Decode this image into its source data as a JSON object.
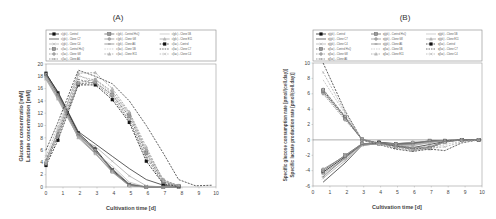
{
  "legend_entries": [
    "c(glc) - Control",
    "c(glc) - Control HsQ",
    "c(glc) - Clone 5B",
    "c(glc) - Clone C7",
    "c(glc) - Clone G8",
    "c(glc) - Clone E11",
    "c(glc) - Clone C4",
    "c(glc) - Clone A6",
    "c(lac) - Control",
    "c(lac) - Control HsQ",
    "c(lac) - Clone 5B",
    "c(lac) - Clone C7",
    "c(lac) - Clone G8",
    "c(lac) - Clone E11",
    "c(lac) - Clone C4",
    "c(lac) - Clone A6"
  ],
  "chart_data": [
    {
      "type": "line",
      "title": "(A)",
      "xlabel": "Cultivation time [d]",
      "ylabel": [
        "Glucose concentratio [mM]",
        "Lactate concentration [mM]"
      ],
      "xlim": [
        0,
        10
      ],
      "ylim": [
        0,
        20
      ],
      "xticks": [
        0,
        1,
        2,
        3,
        4,
        5,
        6,
        7,
        8,
        9,
        10
      ],
      "yticks": [
        0,
        2,
        4,
        6,
        8,
        10,
        12,
        14,
        16,
        18,
        20
      ],
      "grid": false,
      "legend_position": "top",
      "series": [
        {
          "name": "c(glc) - Control",
          "style": "solid",
          "marker": "square-filled",
          "x": [
            0,
            0.7,
            1.9,
            2.9,
            3.9,
            4.9,
            5.9,
            6.9,
            7.8
          ],
          "y": [
            18.5,
            15.3,
            8.8,
            6.2,
            2.8,
            0.4,
            0,
            0,
            0
          ]
        },
        {
          "name": "c(glc) - Control HsQ",
          "style": "solid",
          "marker": "square",
          "x": [
            0,
            0.7,
            1.9,
            2.9,
            3.9,
            4.9,
            5.9,
            6.9,
            7.8
          ],
          "y": [
            18.3,
            15.0,
            8.6,
            6.0,
            2.6,
            0.3,
            0,
            0,
            0
          ]
        },
        {
          "name": "c(glc) - Clone 5B",
          "style": "solid",
          "marker": "none",
          "x": [
            0,
            0.7,
            1.9,
            2.9,
            3.9,
            4.9,
            5.9,
            6.9,
            7.8
          ],
          "y": [
            18.0,
            14.8,
            8.4,
            5.6,
            3.4,
            0.8,
            0,
            0,
            0
          ]
        },
        {
          "name": "c(glc) - Clone C7",
          "style": "solid",
          "marker": "none",
          "x": [
            0,
            0.7,
            1.9,
            2.9,
            3.9,
            4.9,
            5.9,
            6.9,
            7.8
          ],
          "y": [
            18.4,
            15.5,
            9.0,
            7.0,
            5.0,
            3.0,
            1.2,
            0.3,
            0
          ]
        },
        {
          "name": "c(glc) - Clone G8",
          "style": "solid",
          "marker": "circle",
          "x": [
            0,
            0.7,
            1.9,
            2.9,
            3.9,
            4.9,
            5.9,
            6.9,
            7.8
          ],
          "y": [
            17.8,
            14.6,
            8.2,
            5.5,
            2.5,
            0.2,
            0,
            0,
            0
          ]
        },
        {
          "name": "c(glc) - Clone E11",
          "style": "solid",
          "marker": "triangle",
          "x": [
            0,
            0.7,
            1.9,
            2.9,
            3.9,
            4.9,
            5.9,
            6.9,
            7.8
          ],
          "y": [
            17.6,
            14.4,
            8.0,
            5.4,
            2.4,
            0.2,
            0,
            0,
            0
          ]
        },
        {
          "name": "c(glc) - Clone C4",
          "style": "solid",
          "marker": "x",
          "x": [
            0,
            0.7,
            1.9,
            2.9,
            3.9,
            4.9,
            5.9,
            6.9,
            7.8
          ],
          "y": [
            17.5,
            14.2,
            8.1,
            6.6,
            4.2,
            1.8,
            0.2,
            0,
            0
          ]
        },
        {
          "name": "c(glc) - Clone A6",
          "style": "solid",
          "marker": "dash",
          "x": [
            0,
            0.7,
            1.9,
            2.9,
            3.9,
            4.9,
            5.9,
            6.9,
            7.8
          ],
          "y": [
            18.2,
            15.0,
            8.5,
            5.8,
            3.0,
            0.5,
            0,
            0,
            0
          ]
        },
        {
          "name": "c(lac) - Control",
          "style": "dashed",
          "marker": "square-filled",
          "x": [
            0,
            0.7,
            1.9,
            2.9,
            3.9,
            4.9,
            5.9,
            6.9,
            7.8
          ],
          "y": [
            3.5,
            7.6,
            16.6,
            16.6,
            14.2,
            10.5,
            4.2,
            0.5,
            0.1
          ]
        },
        {
          "name": "c(lac) - Control HsQ",
          "style": "dashed",
          "marker": "square",
          "x": [
            0,
            0.7,
            1.9,
            2.9,
            3.9,
            4.9,
            5.9,
            6.9,
            7.8
          ],
          "y": [
            3.8,
            8.3,
            16.8,
            17.0,
            15.0,
            11.5,
            5.5,
            0.8,
            0.2
          ]
        },
        {
          "name": "c(lac) - Clone 5B",
          "style": "dashed",
          "marker": "none",
          "x": [
            0,
            0.7,
            1.9,
            2.9,
            3.9,
            4.9,
            5.9,
            6.9,
            7.8
          ],
          "y": [
            4.5,
            9.0,
            18.0,
            17.4,
            15.2,
            11.8,
            5.8,
            1.0,
            0.3
          ]
        },
        {
          "name": "c(lac) - Clone C7",
          "style": "dashed",
          "marker": "none",
          "x": [
            0,
            0.7,
            1.9,
            2.9,
            3.9,
            4.9,
            5.9,
            6.9,
            7.8,
            8.8,
            9.8
          ],
          "y": [
            6.0,
            10.5,
            19.0,
            18.0,
            16.8,
            14.0,
            10.0,
            5.5,
            1.2,
            0.2,
            0.3
          ]
        },
        {
          "name": "c(lac) - Clone G8",
          "style": "dashed",
          "marker": "circle",
          "x": [
            0,
            0.7,
            1.9,
            2.9,
            3.9,
            4.9,
            5.9,
            6.9,
            7.8
          ],
          "y": [
            4.0,
            8.5,
            17.0,
            17.5,
            15.5,
            12.0,
            6.0,
            1.2,
            0.2
          ]
        },
        {
          "name": "c(lac) - Clone E11",
          "style": "dashed",
          "marker": "triangle",
          "x": [
            0,
            0.7,
            1.9,
            2.9,
            3.9,
            4.9,
            5.9,
            6.9,
            7.8
          ],
          "y": [
            4.2,
            9.2,
            18.5,
            18.6,
            16.0,
            12.2,
            6.5,
            1.0,
            0.2
          ]
        },
        {
          "name": "c(lac) - Clone C4",
          "style": "dashed",
          "marker": "x",
          "x": [
            0,
            0.7,
            1.9,
            2.9,
            3.9,
            4.9,
            5.9,
            6.9,
            7.8
          ],
          "y": [
            5.0,
            9.8,
            18.2,
            17.0,
            15.0,
            11.0,
            5.0,
            1.0,
            0.2
          ]
        },
        {
          "name": "c(lac) - Clone A6",
          "style": "dashed",
          "marker": "dash",
          "x": [
            0,
            0.7,
            1.9,
            2.9,
            3.9,
            4.9,
            5.9,
            6.9,
            7.8
          ],
          "y": [
            4.4,
            8.8,
            17.5,
            16.8,
            14.6,
            10.8,
            4.8,
            0.6,
            0.1
          ]
        }
      ]
    },
    {
      "type": "line",
      "title": "(B)",
      "xlabel": "Cultivation time [d]",
      "ylabel": [
        "Specific glucose consumption rate [pmol/(cell.day)]",
        "Specific lactate production rate [pmol/(cell.day)]"
      ],
      "xlim": [
        0,
        10
      ],
      "ylim": [
        -6,
        10
      ],
      "xticks": [
        0,
        1,
        2,
        3,
        4,
        5,
        6,
        7,
        8,
        9,
        10
      ],
      "yticks": [
        -6,
        -4,
        -2,
        0,
        2,
        4,
        6,
        8,
        10
      ],
      "grid": false,
      "legend_position": "top",
      "series": [
        {
          "name": "q(glc) - Control",
          "style": "solid",
          "marker": "square-filled",
          "x": [
            0.6,
            1.9,
            2.9,
            3.9,
            4.9,
            5.9,
            6.9,
            7.8,
            8.8,
            9.8
          ],
          "y": [
            -4.2,
            -2.2,
            -0.6,
            -0.3,
            -0.5,
            -0.4,
            -0.2,
            -0.1,
            0,
            0
          ]
        },
        {
          "name": "q(glc) - Control HsQ",
          "style": "solid",
          "marker": "square",
          "x": [
            0.6,
            1.9,
            2.9,
            3.9,
            4.9,
            5.9,
            6.9,
            7.8,
            8.8,
            9.8
          ],
          "y": [
            -4.0,
            -2.0,
            -0.5,
            -0.4,
            -0.6,
            -0.5,
            -0.1,
            -0.1,
            0,
            0
          ]
        },
        {
          "name": "q(glc) - Clone 5B",
          "style": "solid",
          "marker": "none",
          "x": [
            0.6,
            1.9,
            2.9,
            3.9,
            4.9,
            5.9,
            6.9,
            7.8,
            8.8,
            9.8
          ],
          "y": [
            -4.6,
            -2.5,
            -0.6,
            -0.5,
            -0.7,
            -0.8,
            -0.3,
            -0.1,
            0,
            0
          ]
        },
        {
          "name": "q(glc) - Clone C7",
          "style": "solid",
          "marker": "none",
          "x": [
            0.6,
            1.9,
            2.9,
            3.9,
            4.9,
            5.9,
            6.9,
            7.8,
            8.8,
            9.8
          ],
          "y": [
            -5.5,
            -3.0,
            -0.7,
            -0.5,
            -0.8,
            -1.0,
            -0.6,
            -0.2,
            0,
            0
          ]
        },
        {
          "name": "q(glc) - Clone G8",
          "style": "solid",
          "marker": "circle",
          "x": [
            0.6,
            1.9,
            2.9,
            3.9,
            4.9,
            5.9,
            6.9,
            7.8,
            8.8,
            9.8
          ],
          "y": [
            -3.8,
            -2.1,
            -0.5,
            -0.4,
            -0.5,
            -0.3,
            -0.2,
            -0.1,
            0,
            0
          ]
        },
        {
          "name": "q(glc) - Clone E11",
          "style": "solid",
          "marker": "triangle",
          "x": [
            0.6,
            1.9,
            2.9,
            3.9,
            4.9,
            5.9,
            6.9,
            7.8,
            8.8,
            9.8
          ],
          "y": [
            -4.4,
            -2.4,
            -0.6,
            -0.4,
            -0.6,
            -0.6,
            -0.3,
            -0.1,
            0,
            0
          ]
        },
        {
          "name": "q(glc) - Clone C4",
          "style": "solid",
          "marker": "x",
          "x": [
            0.6,
            1.9,
            2.9,
            3.9,
            4.9,
            5.9,
            6.9,
            7.8,
            8.8,
            9.8
          ],
          "y": [
            -5.0,
            -2.7,
            -0.7,
            -0.5,
            -0.7,
            -0.7,
            -0.4,
            -0.1,
            0,
            0
          ]
        },
        {
          "name": "q(glc) - Clone A6",
          "style": "solid",
          "marker": "dash",
          "x": [
            0.6,
            1.9,
            2.9,
            3.9,
            4.9,
            5.9,
            6.9,
            7.8,
            8.8,
            9.8
          ],
          "y": [
            -4.8,
            -2.3,
            -0.6,
            -0.4,
            -0.6,
            -0.5,
            -0.2,
            -0.1,
            0,
            0
          ]
        },
        {
          "name": "q(lac) - Control",
          "style": "dashed",
          "marker": "square-filled",
          "x": [
            0.6,
            1.9,
            2.9,
            3.9,
            4.9,
            5.9,
            6.9,
            7.8,
            8.8,
            9.8
          ],
          "y": [
            6.5,
            3.0,
            0.0,
            -0.4,
            -0.8,
            -1.2,
            -1.0,
            -0.2,
            0,
            0
          ]
        },
        {
          "name": "q(lac) - Control HsQ",
          "style": "dashed",
          "marker": "square",
          "x": [
            0.6,
            1.9,
            2.9,
            3.9,
            4.9,
            5.9,
            6.9,
            7.8,
            8.8,
            9.8
          ],
          "y": [
            6.3,
            2.8,
            0.1,
            -0.5,
            -0.9,
            -1.3,
            -1.1,
            -0.3,
            0,
            0
          ]
        },
        {
          "name": "q(lac) - Clone 5B",
          "style": "dashed",
          "marker": "none",
          "x": [
            0.6,
            1.9,
            2.9,
            3.9,
            4.9,
            5.9,
            6.9,
            7.8,
            8.8,
            9.8
          ],
          "y": [
            7.8,
            3.4,
            0.0,
            -0.5,
            -1.0,
            -1.3,
            -1.2,
            -0.6,
            -0.2,
            0
          ]
        },
        {
          "name": "q(lac) - Clone C7",
          "style": "dashed",
          "marker": "none",
          "x": [
            0.6,
            1.9,
            2.9,
            3.9,
            4.9,
            5.9,
            6.9,
            7.8,
            8.8,
            9.8
          ],
          "y": [
            10.0,
            3.8,
            0.0,
            -0.6,
            -1.2,
            -1.5,
            -1.2,
            -1.4,
            -0.4,
            0
          ]
        },
        {
          "name": "q(lac) - Clone G8",
          "style": "dashed",
          "marker": "circle",
          "x": [
            0.6,
            1.9,
            2.9,
            3.9,
            4.9,
            5.9,
            6.9,
            7.8,
            8.8,
            9.8
          ],
          "y": [
            6.0,
            2.6,
            0.1,
            -0.4,
            -0.7,
            -1.0,
            -0.9,
            -0.2,
            0,
            0
          ]
        },
        {
          "name": "q(lac) - Clone E11",
          "style": "dashed",
          "marker": "triangle",
          "x": [
            0.6,
            1.9,
            2.9,
            3.9,
            4.9,
            5.9,
            6.9,
            7.8,
            8.8,
            9.8
          ],
          "y": [
            6.6,
            3.1,
            0.0,
            -0.5,
            -0.8,
            -1.1,
            -1.0,
            -0.3,
            0,
            0
          ]
        },
        {
          "name": "q(lac) - Clone C4",
          "style": "dashed",
          "marker": "x",
          "x": [
            0.6,
            1.9,
            2.9,
            3.9,
            4.9,
            5.9,
            6.9,
            7.8,
            8.8,
            9.8
          ],
          "y": [
            8.8,
            3.6,
            0.0,
            -0.5,
            -1.1,
            -1.4,
            -1.1,
            -0.9,
            -0.3,
            0
          ]
        },
        {
          "name": "q(lac) - Clone A6",
          "style": "dashed",
          "marker": "dash",
          "x": [
            0.6,
            1.9,
            2.9,
            3.9,
            4.9,
            5.9,
            6.9,
            7.8,
            8.8,
            9.8
          ],
          "y": [
            6.2,
            2.9,
            0.0,
            -0.4,
            -0.8,
            -1.1,
            -0.9,
            -0.2,
            0,
            0
          ]
        }
      ]
    }
  ],
  "legend_B_entries": [
    "q(glc) - Control",
    "q(glc) - Control HsQ",
    "q(glc) - Clone 5B",
    "q(glc) - Clone C7",
    "q(glc) - Clone G8",
    "q(glc) - Clone E11",
    "q(glc) - Clone C4",
    "q(glc) - Clone A6",
    "q(lac) - Control",
    "q(lac) - Control HsQ",
    "q(lac) - Clone 5B",
    "q(lac) - Clone C7",
    "q(lac) - Clone G8",
    "q(lac) - Clone E11",
    "q(lac) - Clone C4",
    "q(lac) - Clone A6"
  ],
  "series_colors": [
    "#111111",
    "#555555",
    "#bbbbbb",
    "#333333",
    "#888888",
    "#999999",
    "#aaaaaa",
    "#777777",
    "#111111",
    "#555555",
    "#bbbbbb",
    "#333333",
    "#888888",
    "#999999",
    "#aaaaaa",
    "#777777"
  ]
}
